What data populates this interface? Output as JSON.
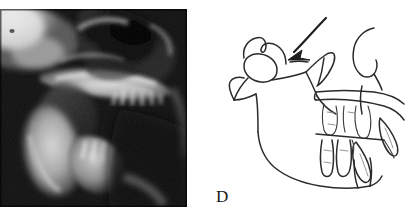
{
  "figure": {
    "panel_label": "D",
    "caption_visible": false,
    "background_color": "#ffffff",
    "width_px": 408,
    "height_px": 221
  },
  "radiograph": {
    "name": "lateral-cephalometric-radiograph",
    "modality_appearance": "grayscale x-ray",
    "frame": {
      "left_px": 0,
      "top_px": 9,
      "width_px": 187,
      "height_px": 198
    },
    "colors": {
      "darkest": "#080808",
      "dark": "#1d1d1d",
      "mid": "#6e6e6e",
      "bright": "#d8d8d8",
      "brightest": "#f2f2f2"
    },
    "visible_structures": [
      "cranial base",
      "maxilla",
      "hard palate",
      "maxillary teeth",
      "mandible",
      "mandibular teeth",
      "mandibular symphysis",
      "airway / soft tissue shadow"
    ]
  },
  "tracing": {
    "name": "cephalometric-tracing",
    "frame": {
      "left_px": 204,
      "top_px": 0,
      "width_px": 204,
      "height_px": 221
    },
    "stroke_color": "#2b2b2b",
    "annotation": {
      "type": "arrow",
      "name": "condyle-pointer-arrow",
      "direction": "down-left",
      "points_to": "condylar head / temporomandibular joint region",
      "tail_point": {
        "x": 325,
        "y": 20
      },
      "head_point": {
        "x": 288,
        "y": 63
      }
    },
    "traced_structures": [
      "glenoid fossa",
      "condylar head",
      "condylar neck",
      "coronoid process",
      "mandibular ramus",
      "mandibular notch (sigmoid)",
      "gonial angle",
      "mandibular body / inferior border",
      "mandibular symphysis",
      "maxillary alveolus and palate",
      "maxillary incisors",
      "maxillary molars",
      "mandibular incisors",
      "mandibular molars",
      "soft tissue profile (forehead, nose, lip)"
    ]
  }
}
